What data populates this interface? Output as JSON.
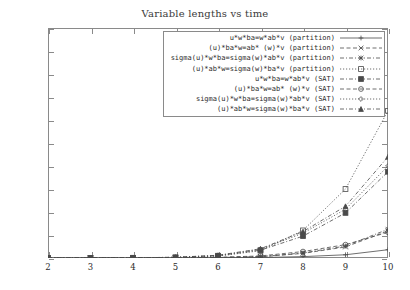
{
  "chart_data": {
    "type": "line",
    "title": "Variable lengths vs time",
    "xlabel": "",
    "ylabel": "",
    "xlim": [
      2,
      10
    ],
    "ylim": [
      0,
      1000
    ],
    "xticks": [
      "2",
      "3",
      "4",
      "5",
      "6",
      "7",
      "8",
      "9",
      "10"
    ],
    "yticks": [
      "0",
      "100",
      "200",
      "300",
      "400",
      "500",
      "600",
      "700",
      "800",
      "900",
      "1000"
    ],
    "grid": false,
    "legend_position": "top-right inside",
    "x": [
      2,
      3,
      4,
      5,
      6,
      7,
      8,
      9,
      10
    ],
    "series": [
      {
        "name": "u*w*ba=w*ab*v (partition)",
        "marker": "plus",
        "dash": "solid",
        "values": [
          0,
          0,
          0,
          0,
          1,
          2,
          6,
          14,
          36
        ]
      },
      {
        "name": "(u)*ba*w=ab* (w)*v (partition)",
        "marker": "cross",
        "dash": "dashed",
        "values": [
          0,
          0,
          0,
          1,
          2,
          5,
          20,
          48,
          118
        ]
      },
      {
        "name": "sigma(u)*w*ba=sigma(w)*ab*v (partition)",
        "marker": "star",
        "dash": "dash-dot",
        "values": [
          0,
          0,
          0,
          1,
          2,
          6,
          22,
          52,
          125
        ]
      },
      {
        "name": "(u)*ab*w=sigma(w)*ba*v (partition)",
        "marker": "open-square",
        "dash": "dotted",
        "values": [
          0,
          0,
          1,
          2,
          8,
          32,
          120,
          300,
          640
        ]
      },
      {
        "name": "u*w*ba=w*ab*v (SAT)",
        "marker": "filled-square",
        "dash": "dash-dot",
        "values": [
          0,
          0,
          1,
          3,
          10,
          34,
          95,
          196,
          375
        ]
      },
      {
        "name": "(u)*ba*w=ab* (w)*v (SAT)",
        "marker": "open-circle",
        "dash": "dashed",
        "values": [
          0,
          0,
          0,
          1,
          3,
          9,
          28,
          58,
          112
        ]
      },
      {
        "name": "sigma(u)*w*ba=sigma(w)*ab*v (SAT)",
        "marker": "open-diamond",
        "dash": "dotted",
        "values": [
          0,
          0,
          1,
          3,
          11,
          38,
          108,
          212,
          400
        ]
      },
      {
        "name": "(u)*ab*w=sigma(w)*ba*v (SAT)",
        "marker": "triangle",
        "dash": "dash-dot",
        "values": [
          0,
          0,
          1,
          3,
          12,
          40,
          115,
          225,
          440
        ]
      }
    ]
  }
}
